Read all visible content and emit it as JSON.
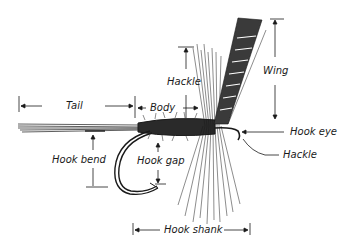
{
  "diagram": {
    "labels": {
      "tail": "Tail",
      "body": "Body",
      "hackle_top": "Hackle",
      "wing": "Wing",
      "hook_eye": "Hook eye",
      "hackle_bottom": "Hackle",
      "hook_bend": "Hook bend",
      "hook_gap": "Hook gap",
      "hook_shank": "Hook shank"
    },
    "colors": {
      "ink": "#1a1a1a",
      "background": "#ffffff"
    }
  }
}
